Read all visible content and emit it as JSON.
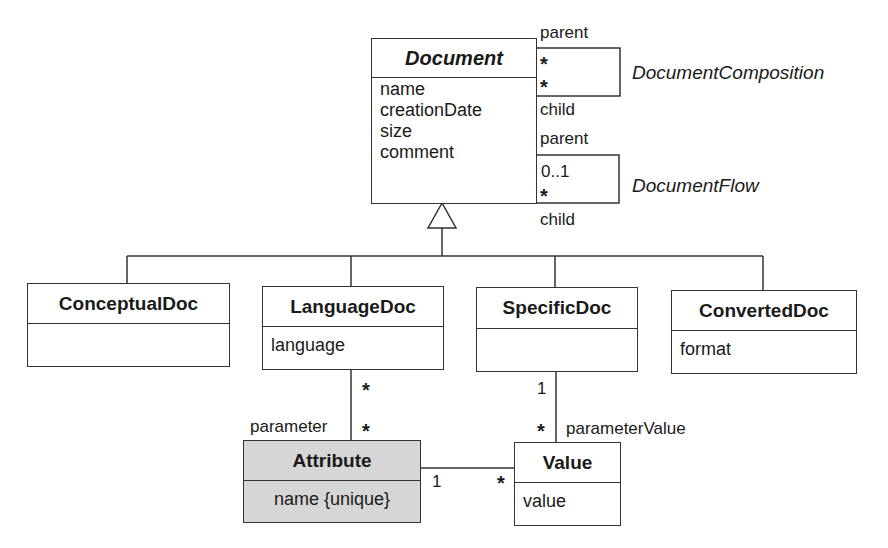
{
  "classes": {
    "document": {
      "name": "Document",
      "attributes": [
        "name",
        "creationDate",
        "size",
        "comment"
      ]
    },
    "conceptual": {
      "name": "ConceptualDoc",
      "attributes": []
    },
    "language": {
      "name": "LanguageDoc",
      "attributes": [
        "language"
      ]
    },
    "specific": {
      "name": "SpecificDoc",
      "attributes": []
    },
    "converted": {
      "name": "ConvertedDoc",
      "attributes": [
        "format"
      ]
    },
    "attribute": {
      "name": "Attribute",
      "attributes": [
        "name {unique}"
      ]
    },
    "value": {
      "name": "Value",
      "attributes": [
        "value"
      ]
    }
  },
  "associations": {
    "composition": {
      "name": "DocumentComposition",
      "role_top": "parent",
      "role_bottom": "child",
      "mult_top": "*",
      "mult_bottom": "*"
    },
    "flow": {
      "name": "DocumentFlow",
      "role_top": "parent",
      "role_bottom": "child",
      "mult_top": "0..1",
      "mult_bottom": "*"
    },
    "lang_attr": {
      "role": "parameter",
      "mult_top": "*",
      "mult_bottom": "*"
    },
    "spec_value": {
      "role": "parameterValue",
      "mult_top": "1",
      "mult_bottom": "*"
    },
    "attr_value": {
      "mult_left": "1",
      "mult_right": "*"
    }
  }
}
